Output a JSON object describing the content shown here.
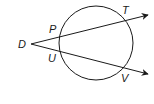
{
  "diagram": {
    "circle": {
      "cx": 96,
      "cy": 43,
      "r": 37
    },
    "external_point": {
      "label": "D",
      "x": 30,
      "y": 44
    },
    "secants": [
      {
        "name": "DT",
        "through": [
          "P",
          "T"
        ],
        "end": {
          "x": 148,
          "y": 15
        }
      },
      {
        "name": "DV",
        "through": [
          "U",
          "V"
        ],
        "end": {
          "x": 148,
          "y": 74
        }
      }
    ],
    "labels": {
      "D": "D",
      "P": "P",
      "T": "T",
      "U": "U",
      "V": "V"
    },
    "colors": {
      "stroke": "#1a1a1a",
      "background": "#ffffff"
    }
  }
}
